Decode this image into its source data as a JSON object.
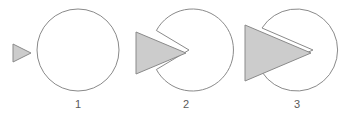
{
  "diagram": {
    "background_color": "#ffffff",
    "stroke_color": "#8a8a8a",
    "fill_color": "#cccccc",
    "label_color": "#5a5a5a",
    "stages": [
      {
        "label": "1",
        "description": "wedge outside circle, circle intact",
        "circle": {
          "cx": 78,
          "cy": 50,
          "r": 41
        },
        "notch_depth": 0,
        "triangle": {
          "apex_x": 31,
          "base_x": 13,
          "cy": 53,
          "half_height": 9
        }
      },
      {
        "label": "2",
        "description": "wedge partially penetrating, notch opened in circle",
        "circle": {
          "cx": 189,
          "cy": 50,
          "r": 41
        },
        "notch_depth": 41,
        "triangle": {
          "apex_x": 186,
          "base_x": 136,
          "cy": 53,
          "half_height": 21
        }
      },
      {
        "label": "3",
        "description": "wedge deeply penetrating, notch reaches past centre",
        "circle": {
          "cx": 297,
          "cy": 50,
          "r": 41
        },
        "notch_depth": 60,
        "triangle": {
          "apex_x": 311,
          "base_x": 245,
          "cy": 53,
          "half_height": 28
        }
      }
    ],
    "labels": {
      "one": "1",
      "two": "2",
      "three": "3"
    }
  }
}
